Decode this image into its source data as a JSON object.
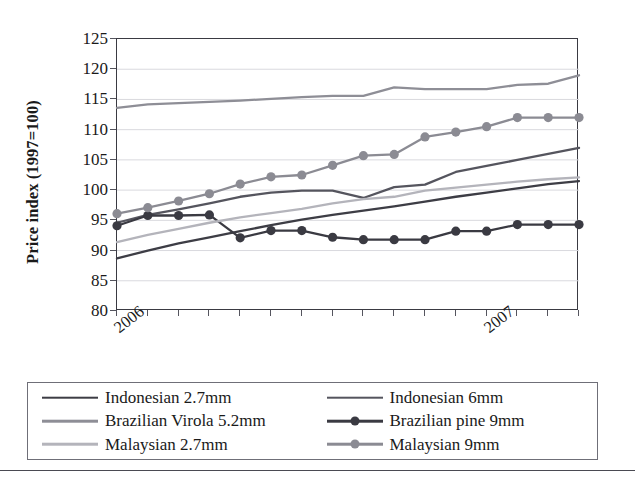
{
  "chart_data": {
    "type": "line",
    "title": "",
    "xlabel": "",
    "ylabel": "Price index (1997=100)",
    "ylim": [
      80,
      125
    ],
    "yticks": [
      80,
      85,
      90,
      95,
      100,
      105,
      110,
      115,
      120,
      125
    ],
    "grid": true,
    "legend_position": "bottom",
    "x_tick_labels": [
      "2006",
      "2007"
    ],
    "x_tick_label_positions": [
      0,
      12
    ],
    "x_tick_count": 16,
    "x": [
      0,
      1,
      2,
      3,
      4,
      5,
      6,
      7,
      8,
      9,
      10,
      11,
      12,
      13,
      14,
      15
    ],
    "series": [
      {
        "name": "Indonesian 2.7mm",
        "color": "#3d3d45",
        "marker": "none",
        "values": [
          88.7,
          90.0,
          91.2,
          92.2,
          93.2,
          94.2,
          95.1,
          95.9,
          96.6,
          97.3,
          98.1,
          98.9,
          99.6,
          100.3,
          101.0,
          101.5
        ]
      },
      {
        "name": "Indonesian 6mm",
        "color": "#55555e",
        "marker": "none",
        "values": [
          94.6,
          95.9,
          96.8,
          97.8,
          98.9,
          99.6,
          99.9,
          99.9,
          98.7,
          100.5,
          100.9,
          103.0,
          104.0,
          105.0,
          106.0,
          107.0
        ]
      },
      {
        "name": "Brazilian Virola 5.2mm",
        "color": "#8e8e96",
        "marker": "none",
        "values": [
          113.6,
          114.2,
          114.4,
          114.6,
          114.8,
          115.1,
          115.4,
          115.6,
          115.6,
          117.0,
          116.7,
          116.7,
          116.7,
          117.4,
          117.6,
          119.0
        ]
      },
      {
        "name": "Brazilian pine 9mm",
        "color": "#3a3a42",
        "marker": "circle",
        "values": [
          94.1,
          95.8,
          95.8,
          95.9,
          92.1,
          93.3,
          93.3,
          92.2,
          91.8,
          91.8,
          91.8,
          93.2,
          93.2,
          94.3,
          94.3,
          94.3
        ]
      },
      {
        "name": "Malaysian 2.7mm",
        "color": "#b4b4bb",
        "marker": "none",
        "values": [
          91.4,
          92.6,
          93.6,
          94.6,
          95.5,
          96.2,
          96.9,
          97.8,
          98.5,
          98.9,
          99.9,
          100.4,
          100.9,
          101.4,
          101.8,
          102.1
        ]
      },
      {
        "name": "Malaysian 9mm",
        "color": "#8b8b93",
        "marker": "circle",
        "values": [
          96.1,
          97.1,
          98.2,
          99.4,
          101.0,
          102.2,
          102.5,
          104.1,
          105.7,
          105.9,
          108.8,
          109.6,
          110.5,
          112.0,
          112.0,
          112.0
        ]
      }
    ]
  },
  "axis": {
    "y_label": "Price index (1997=100)",
    "y_tick_labels": [
      "125",
      "120",
      "115",
      "110",
      "105",
      "100",
      "95",
      "90",
      "85",
      "80"
    ],
    "x_tick_labels": [
      "2006",
      "2007"
    ]
  },
  "legend": {
    "entries": [
      {
        "label": "Indonesian 2.7mm",
        "color": "#3d3d45",
        "marker": "none"
      },
      {
        "label": "Indonesian 6mm",
        "color": "#55555e",
        "marker": "none"
      },
      {
        "label": "Brazilian Virola 5.2mm",
        "color": "#8e8e96",
        "marker": "none"
      },
      {
        "label": "Brazilian pine 9mm",
        "color": "#3a3a42",
        "marker": "circle"
      },
      {
        "label": "Malaysian 2.7mm",
        "color": "#b4b4bb",
        "marker": "none"
      },
      {
        "label": "Malaysian 9mm",
        "color": "#8b8b93",
        "marker": "circle"
      }
    ]
  },
  "colors": {
    "plot_border": "#3a3a42",
    "gridline": "#d9d9de",
    "legend_border": "#6f6f78",
    "footer_rule": "#4a4a52",
    "background": "#ffffff"
  }
}
